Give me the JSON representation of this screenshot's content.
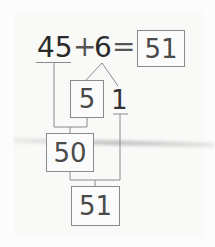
{
  "equation": {
    "addend1": "45",
    "plus": "+",
    "addend2": "6",
    "equals": "=",
    "result": "51"
  },
  "decomposition": {
    "part_a": "5",
    "part_b": "1"
  },
  "steps": {
    "partial_sum": "50",
    "final_sum": "51"
  }
}
